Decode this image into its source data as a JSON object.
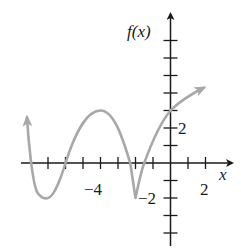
{
  "chart_data": {
    "type": "line",
    "title": "",
    "xlabel": "x",
    "ylabel": "f(x)",
    "xlim": [
      -8.4,
      3.4
    ],
    "ylim": [
      -4.3,
      7.5
    ],
    "x_tick_step": 1,
    "y_tick_step": 1,
    "x_tick_labels": [
      {
        "value": -4,
        "text": "−4"
      },
      {
        "value": 2,
        "text": "2"
      }
    ],
    "y_tick_labels": [
      {
        "value": 2,
        "text": "2"
      },
      {
        "value": -2,
        "text": "−2"
      }
    ],
    "grid": false,
    "legend": null,
    "series": [
      {
        "name": "f(x)",
        "color": "#a8a8a8",
        "points": [
          {
            "x": -8.2,
            "y": 2.6
          },
          {
            "x": -8.0,
            "y": 0
          },
          {
            "x": -7.0,
            "y": -2
          },
          {
            "x": -6.0,
            "y": 0
          },
          {
            "x": -4.0,
            "y": 3
          },
          {
            "x": -2.3,
            "y": 0
          },
          {
            "x": -2.0,
            "y": -2
          },
          {
            "x": -1.5,
            "y": 0
          },
          {
            "x": 0.0,
            "y": 3
          },
          {
            "x": 1.9,
            "y": 4.3
          }
        ],
        "features": {
          "left_end": "arrow up",
          "right_end": "arrow up-right",
          "local_min": [
            {
              "x": -7,
              "y": -2
            },
            {
              "x": -2,
              "y": -2,
              "note": "cusp"
            }
          ],
          "local_max": [
            {
              "x": -4,
              "y": 3
            }
          ],
          "x_intercepts": [
            -8,
            -6,
            -2.3,
            -1.5
          ],
          "y_intercept": 3
        }
      }
    ]
  },
  "labels": {
    "y_axis": "f(x)",
    "x_axis": "x",
    "x_tick_neg4": "−4",
    "x_tick_2": "2",
    "y_tick_2": "2",
    "y_tick_neg2": "−2"
  }
}
